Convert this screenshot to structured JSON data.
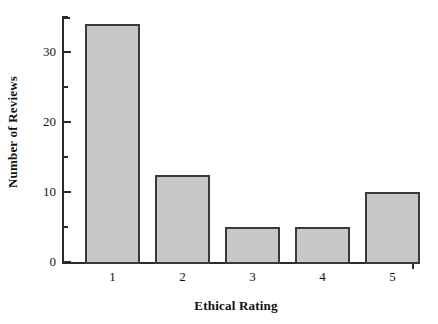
{
  "chart_data": {
    "type": "bar",
    "title": "",
    "subtitle": "",
    "xlabel": "Ethical Rating",
    "ylabel": "Number of Reviews",
    "categories": [
      "1",
      "2",
      "3",
      "4",
      "5"
    ],
    "values": [
      34,
      12.5,
      5,
      5,
      10
    ],
    "ylim": [
      0,
      35
    ],
    "xlim_note": "categorical, 5 bars",
    "y_major_ticks": [
      0,
      10,
      20,
      30
    ],
    "y_major_tick_labels": [
      "0",
      "10",
      "20",
      "30"
    ],
    "y_minor_ticks": [
      5,
      15,
      25,
      35
    ],
    "grid": false,
    "legend": null,
    "legend_position": "none",
    "annotations": [],
    "series": [
      {
        "name": "Number of Reviews",
        "values": [
          34,
          12.5,
          5,
          5,
          10
        ]
      }
    ],
    "style": {
      "bar_fill": "#c8c8c8",
      "bar_edge": "#3a3a3a",
      "axis_color": "#2b2b2b",
      "text_color": "#111111",
      "background": "#ffffff"
    }
  },
  "axis": {
    "y_title": "Number of Reviews",
    "x_title": "Ethical Rating"
  }
}
